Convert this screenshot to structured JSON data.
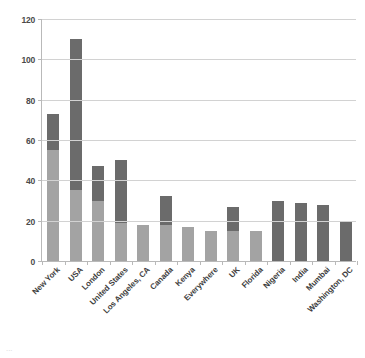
{
  "chart_data": {
    "type": "bar",
    "title": "",
    "subtitle": "",
    "xlabel": "",
    "ylabel": "",
    "stacked": true,
    "grid": true,
    "legend": false,
    "legend_position": "none",
    "ylim": [
      0,
      120
    ],
    "yticks": [
      0,
      20,
      40,
      60,
      80,
      100,
      120
    ],
    "ytick_labels": [
      "0",
      "20",
      "40",
      "60",
      "80",
      "100",
      "120"
    ],
    "categories": [
      "New York",
      "USA",
      "London",
      "United States",
      "Los Angeles, CA",
      "Canada",
      "Kenya",
      "Everywhere",
      "UK",
      "Florida",
      "Nigeria",
      "India",
      "Mumbai",
      "Washington, DC"
    ],
    "series": [
      {
        "name": "lower-segment",
        "color": "#a3a3a3",
        "values": [
          55,
          35,
          30,
          19,
          18,
          18,
          17,
          15,
          15,
          15,
          0,
          0,
          0,
          0
        ]
      },
      {
        "name": "upper-segment",
        "color": "#6b6b6b",
        "values": [
          18,
          75,
          17,
          31,
          0,
          14,
          0,
          0,
          12,
          0,
          30,
          29,
          28,
          20
        ]
      }
    ],
    "totals": [
      73,
      110,
      47,
      50,
      18,
      32,
      17,
      15,
      27,
      15,
      30,
      29,
      28,
      20
    ]
  },
  "style": {
    "gridline_color": "#d2d2d2",
    "axis_color": "#b9b9b9",
    "tick_label_color": "#4a4a4a",
    "category_label_color": "#3d3d3d",
    "background": "#ffffff"
  },
  "caption": {
    "text": "..."
  }
}
